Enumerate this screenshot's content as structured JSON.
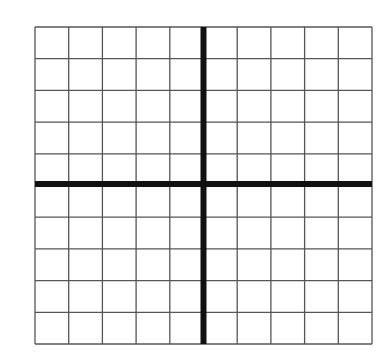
{
  "diagram": {
    "type": "coordinate-grid",
    "columns": 10,
    "rows": 10,
    "bounds": {
      "left": 35,
      "top": 27,
      "right": 372,
      "bottom": 344
    },
    "axis_column_index": 5,
    "axis_row_index": 5,
    "colors": {
      "background": "#ffffff",
      "grid_line": "#555555",
      "axis_line": "#111111"
    },
    "grid_line_width": 1.3,
    "axis_line_width": 6
  }
}
